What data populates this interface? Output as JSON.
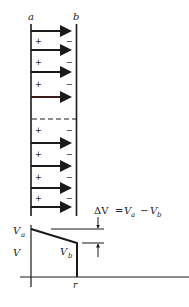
{
  "diagram": {
    "plates": {
      "left_label": "a",
      "right_label": "b"
    },
    "field_arrows_y": [
      31,
      50,
      72,
      97,
      143,
      166,
      188,
      207
    ],
    "charges": [
      {
        "y": 41,
        "left": "+",
        "right": "−"
      },
      {
        "y": 62,
        "left": "+",
        "right": "−"
      },
      {
        "y": 84,
        "left": "+",
        "right": "−"
      },
      {
        "y": 130,
        "left": "+",
        "right": "−"
      },
      {
        "y": 154,
        "left": "+",
        "right": "−"
      },
      {
        "y": 177,
        "left": "+",
        "right": "−"
      },
      {
        "y": 198,
        "left": "+",
        "right": "−"
      }
    ],
    "dashed_line_y": 119,
    "formula": {
      "delta_v": "ΔV",
      "equals": "=",
      "va": "V",
      "va_sub": "a",
      "minus": "−",
      "vb": "V",
      "vb_sub": "b"
    },
    "graph": {
      "y_axis_label": "V",
      "x_axis_label": "r",
      "va_label": "V",
      "va_sub": "a",
      "vb_label": "V",
      "vb_sub": "b"
    }
  }
}
